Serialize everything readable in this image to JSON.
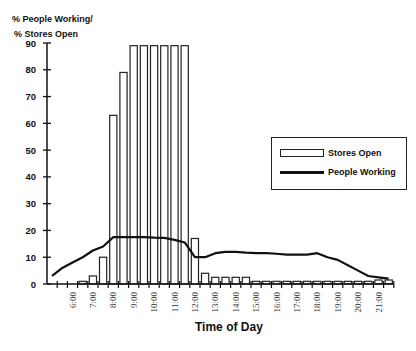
{
  "chart_data": {
    "type": "bar",
    "title": "",
    "ylabel_line1": "% People Working/",
    "ylabel_line2": "% Stores Open",
    "xlabel": "Time of Day",
    "ylim": [
      0,
      90
    ],
    "yticks": [
      0,
      10,
      20,
      30,
      40,
      50,
      60,
      70,
      80,
      90
    ],
    "grid": false,
    "legend_position": "right",
    "categories": [
      "5:00",
      "5:30",
      "6:00",
      "6:30",
      "7:00",
      "7:30",
      "8:00",
      "8:30",
      "9:00",
      "9:30",
      "10:00",
      "10:30",
      "11:00",
      "11:30",
      "12:00",
      "12:30",
      "13:00",
      "13:30",
      "14:00",
      "14:30",
      "15:00",
      "15:30",
      "16:00",
      "16:30",
      "17:00",
      "17:30",
      "18:00",
      "18:30",
      "19:00",
      "19:30",
      "20:00",
      "20:30",
      "21:00",
      "21:30"
    ],
    "xtick_labels": [
      "6:00",
      "7:00",
      "8:00",
      "9:00",
      "10:00",
      "11:00",
      "12:00",
      "13:00",
      "14:00",
      "15:00",
      "16:00",
      "17:00",
      "18:00",
      "19:00",
      "20:00",
      "21:00"
    ],
    "series": [
      {
        "name": "Stores Open",
        "type": "bar",
        "values": [
          0,
          0,
          0,
          1,
          3,
          10,
          63,
          79,
          89,
          89,
          89,
          89,
          89,
          89,
          17,
          4,
          2.5,
          2.5,
          2.5,
          2.5,
          1,
          1,
          1,
          1,
          1,
          1,
          1,
          1,
          1,
          1,
          1,
          1,
          1.5,
          1.5
        ]
      },
      {
        "name": "People Working",
        "type": "line",
        "values": [
          3,
          6,
          8,
          10,
          12.5,
          14,
          17.5,
          17.5,
          17.5,
          17.5,
          17.3,
          17.2,
          16.5,
          15.5,
          10,
          10,
          11.5,
          12,
          12,
          11.7,
          11.5,
          11.5,
          11.3,
          11,
          11,
          11,
          11.5,
          10,
          9,
          7,
          5,
          3,
          2.5,
          2
        ]
      }
    ]
  },
  "legend": {
    "items": [
      {
        "label": "Stores Open"
      },
      {
        "label": "People Working"
      }
    ]
  }
}
